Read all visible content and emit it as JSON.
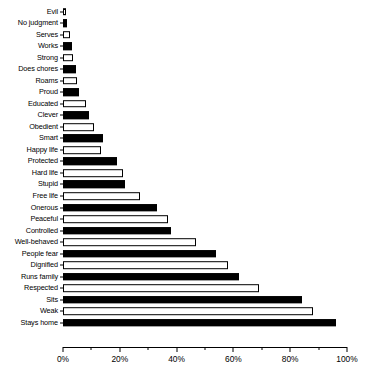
{
  "chart_data": {
    "type": "bar",
    "orientation": "horizontal",
    "title": "",
    "subtitle": "",
    "xlabel": "",
    "ylabel": "",
    "xlim": [
      0,
      100
    ],
    "grid": false,
    "legend": null,
    "axis_tick_labels": [
      "0%",
      "20%",
      "40%",
      "60%",
      "80%",
      "100%"
    ],
    "axis_tick_values": [
      0,
      20,
      40,
      60,
      80,
      100
    ],
    "axis_minor_tick_values": [
      10,
      30,
      50,
      70,
      90
    ],
    "value_suffix": "%",
    "colors": {
      "bar_black": "#000000",
      "bar_white": "#ffffff",
      "bar_outline": "#000000",
      "axis": "#000000",
      "background": "#ffffff"
    },
    "categories": [
      "Evil",
      "No judgment",
      "Serves",
      "Works",
      "Strong",
      "Does chores",
      "Roams",
      "Proud",
      "Educated",
      "Clever",
      "Obedient",
      "Smart",
      "Happy life",
      "Protected",
      "Hard life",
      "Stupid",
      "Free life",
      "Onerous",
      "Peaceful",
      "Controlled",
      "Well-behaved",
      "People fear",
      "Dignified",
      "Runs family",
      "Respected",
      "Sits",
      "Weak",
      "Stays home"
    ],
    "values": [
      1,
      1.5,
      2.5,
      3,
      3.5,
      4.5,
      5,
      5.5,
      8,
      9,
      11,
      14,
      13.5,
      19,
      21,
      22,
      27,
      33,
      37,
      38,
      47,
      54,
      58,
      62,
      69,
      84,
      88,
      96
    ],
    "fills": [
      "white",
      "black",
      "white",
      "black",
      "white",
      "black",
      "white",
      "black",
      "white",
      "black",
      "white",
      "black",
      "white",
      "black",
      "white",
      "black",
      "white",
      "black",
      "white",
      "black",
      "white",
      "black",
      "white",
      "black",
      "white",
      "black",
      "white",
      "black"
    ]
  }
}
